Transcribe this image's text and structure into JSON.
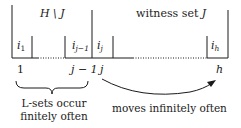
{
  "diagram": {
    "top_labels": {
      "left_region": "H \\ J",
      "right_region_text": "witness set ",
      "right_region_var": "J"
    },
    "cells": [
      {
        "var": "i",
        "sub": "1"
      },
      {
        "var": "i",
        "sub": "j−1"
      },
      {
        "var": "i",
        "sub": "j"
      },
      {
        "var": "i",
        "sub": "h"
      }
    ],
    "indices": {
      "first": "1",
      "j_minus_1": "j − 1",
      "j": "j",
      "h": "h"
    },
    "annotations": {
      "brace_line1": "L-sets occur",
      "brace_line2": "finitely often",
      "arrow_text": "moves infinitely often"
    },
    "colors": {
      "line": "#1a1a1a",
      "background": "#ffffff"
    }
  }
}
